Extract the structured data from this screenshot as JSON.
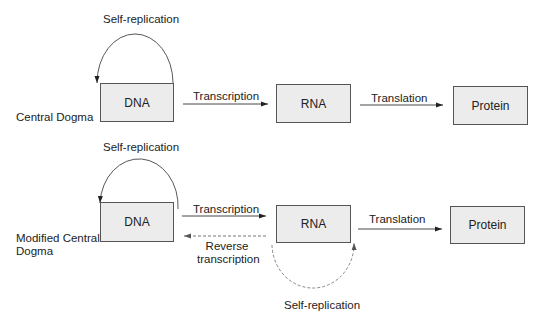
{
  "diagram": {
    "top": {
      "row_label": "Central Dogma",
      "self_replication_label": "Self-replication",
      "nodes": {
        "dna": "DNA",
        "rna": "RNA",
        "protein": "Protein"
      },
      "edges": {
        "transcription": "Transcription",
        "translation": "Translation"
      }
    },
    "bottom": {
      "row_label_line1": "Modified Central",
      "row_label_line2": "Dogma",
      "dna_self_replication_label": "Self-replication",
      "rna_self_replication_label": "Self-replication",
      "nodes": {
        "dna": "DNA",
        "rna": "RNA",
        "protein": "Protein"
      },
      "edges": {
        "transcription": "Transcription",
        "reverse_transcription_line1": "Reverse",
        "reverse_transcription_line2": "transcription",
        "translation": "Translation"
      }
    }
  },
  "colors": {
    "box_fill": "#ececec",
    "box_border": "#555555",
    "line": "#333333",
    "dashed_line": "#888888",
    "text": "#222222"
  }
}
